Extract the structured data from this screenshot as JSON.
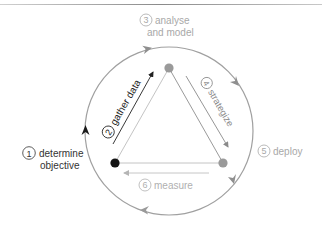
{
  "diagram": {
    "type": "cycle",
    "colors": {
      "cycle_ring": "#9a9a9a",
      "node_start": "#1a1a1a",
      "node_other": "#9a9a9a",
      "step_dark": "#333333",
      "step_mid": "#8a8a8a",
      "step_light": "#a8a8a8",
      "edge_light": "#c4c4c4"
    },
    "steps": [
      {
        "number": "1",
        "label_line1": "determine",
        "label_line2": "objective"
      },
      {
        "number": "2",
        "label": "gather data"
      },
      {
        "number": "3",
        "label_line1": "analyse",
        "label_line2": "and model"
      },
      {
        "number": "4",
        "label": "strategize"
      },
      {
        "number": "5",
        "label": "deploy"
      },
      {
        "number": "6",
        "label": "measure"
      }
    ]
  }
}
